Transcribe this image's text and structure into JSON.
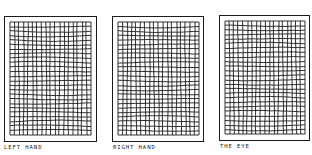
{
  "figure": {
    "panels": [
      {
        "id": "left-hand",
        "label": "LEFT HAND",
        "frame": {
          "x": 4,
          "y": 16,
          "w": 93,
          "h": 126
        },
        "grid": {
          "x": 10,
          "y": 22,
          "w": 81,
          "h": 113,
          "cols": 18,
          "rows": 25
        },
        "label_pos": {
          "x": 4,
          "y": 144
        }
      },
      {
        "id": "right-hand",
        "label": "RIGHT HAND",
        "frame": {
          "x": 112,
          "y": 16,
          "w": 92,
          "h": 126
        },
        "grid": {
          "x": 118,
          "y": 22,
          "w": 81,
          "h": 113,
          "cols": 18,
          "rows": 25
        },
        "label_pos": {
          "x": 113,
          "y": 144
        }
      },
      {
        "id": "the-eye",
        "label": "THE EYE",
        "frame": {
          "x": 219,
          "y": 15,
          "w": 91,
          "h": 126
        },
        "grid": {
          "x": 225,
          "y": 21,
          "w": 80,
          "h": 113,
          "cols": 18,
          "rows": 25
        },
        "label_pos": {
          "x": 220,
          "y": 143
        }
      }
    ],
    "line_color": "#1a1a1a",
    "background": "#ffffff"
  }
}
